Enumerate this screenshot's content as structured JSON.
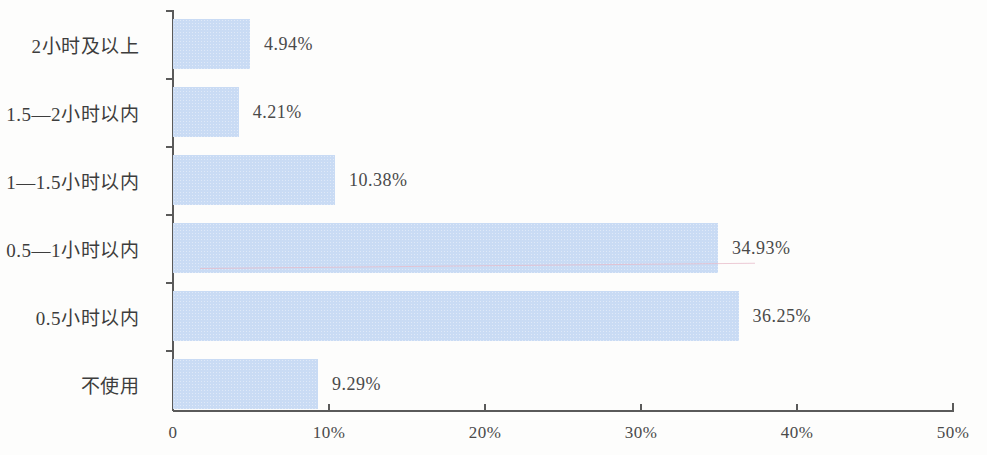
{
  "chart_data": {
    "type": "bar",
    "orientation": "horizontal",
    "title": "",
    "subtitle": "",
    "xlabel": "",
    "ylabel": "",
    "xlim": [
      0,
      50
    ],
    "x_unit": "%",
    "grid": false,
    "legend": null,
    "bar_color": "#c9dbf4",
    "axis_color": "#5a5a5a",
    "text_color": "#4a4a4a",
    "categories": [
      "2小时及以上",
      "1.5—2小时以内",
      "1—1.5小时以内",
      "0.5—1小时以内",
      "0.5小时以内",
      "不使用"
    ],
    "values": [
      4.94,
      4.21,
      10.38,
      34.93,
      36.25,
      9.29
    ],
    "value_labels": [
      "4.94%",
      "4.21%",
      "10.38%",
      "34.93%",
      "36.25%",
      "9.29%"
    ],
    "xticks": [
      0,
      10,
      20,
      30,
      40,
      50
    ],
    "xtick_labels": [
      "0",
      "10%",
      "20%",
      "30%",
      "40%",
      "50%"
    ]
  }
}
